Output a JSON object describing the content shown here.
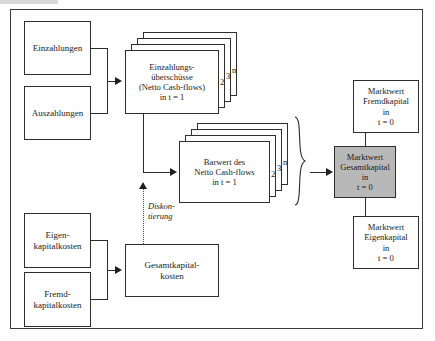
{
  "diagram": {
    "accent_gray": "#b8b8b8",
    "line_color": "#2b2b2b",
    "nodes": {
      "einzahlungen": {
        "label": "Einzahlungen"
      },
      "auszahlungen": {
        "label": "Auszahlungen"
      },
      "einzahlungsueberschuesse": {
        "line1": "Einzahlungs-",
        "line2": "überschüsse",
        "line3": "(Netto Cash-flows)",
        "line4": "in t = 1"
      },
      "barwert": {
        "line1": "Barwert des",
        "line2": "Netto Cash-flows",
        "line3": "in t = 1"
      },
      "eigenkapitalkosten": {
        "line1": "Eigen-",
        "line2": "kapitalkosten"
      },
      "fremdkapitalkosten": {
        "line1": "Fremd-",
        "line2": "kapitalkosten"
      },
      "gesamtkapitalkosten": {
        "line1": "Gesamtkapital-",
        "line2": "kosten"
      },
      "marktwert_gesamtkapital": {
        "line1": "Marktwert",
        "line2": "Gesamtkapital",
        "line3": "in",
        "line4": "t = 0"
      },
      "marktwert_fremdkapital": {
        "line1": "Marktwert",
        "line2": "Fremdkapital",
        "line3": "in",
        "line4": "t = 0"
      },
      "marktwert_eigenkapital": {
        "line1": "Marktwert",
        "line2": "Eigenkapital",
        "line3": "in",
        "line4": "t = 0"
      }
    },
    "stack_labels": {
      "cashflow_2": "2",
      "cashflow_3": "3",
      "cashflow_n": "n",
      "barwert_2": "2",
      "barwert_3": "3",
      "barwert_n": "n"
    },
    "annotations": {
      "diskontierung_line1": "Diskon-",
      "diskontierung_line2": "tierung"
    }
  }
}
